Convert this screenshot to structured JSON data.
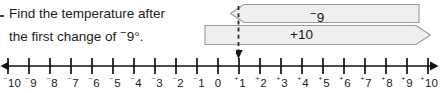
{
  "question": {
    "bullet": "dash-bullet",
    "line1": "Find the temperature after",
    "line2_pre": "the first change of ",
    "line2_value_sign": "−",
    "line2_value": "9°.",
    "full_text": "Find the temperature after the first change of ⁻9°."
  },
  "arrows": [
    {
      "name": "minus-nine-arrow",
      "label_sign": "−",
      "label_value": "9",
      "label": "⁻9",
      "direction": "left",
      "fill": "#efefef",
      "stroke": "#9a9a9a"
    },
    {
      "name": "plus-ten-arrow",
      "label_sign": "+",
      "label_value": "10",
      "label": "+10",
      "direction": "right",
      "fill": "#efefef",
      "stroke": "#9a9a9a"
    }
  ],
  "drop_line": {
    "name": "dashed-indicator",
    "points_to": "+1",
    "style": "dashed",
    "color": "#2b2b2b"
  },
  "number_line": {
    "min": -10,
    "max": 10,
    "step": 1,
    "left_arrow": true,
    "right_arrow": true,
    "axis_color": "#111111",
    "labels": [
      {
        "sign": "⁻",
        "value": "10",
        "text": "⁻10"
      },
      {
        "sign": "⁻",
        "value": "9",
        "text": "⁻9"
      },
      {
        "sign": "⁻",
        "value": "8",
        "text": "⁻8"
      },
      {
        "sign": "⁻",
        "value": "7",
        "text": "⁻7"
      },
      {
        "sign": "⁻",
        "value": "6",
        "text": "⁻6"
      },
      {
        "sign": "⁻",
        "value": "5",
        "text": "⁻5"
      },
      {
        "sign": "⁻",
        "value": "4",
        "text": "⁻4"
      },
      {
        "sign": "⁻",
        "value": "3",
        "text": "⁻3"
      },
      {
        "sign": "⁻",
        "value": "2",
        "text": "⁻2"
      },
      {
        "sign": "⁻",
        "value": "1",
        "text": "⁻1"
      },
      {
        "sign": "",
        "value": "0",
        "text": "0"
      },
      {
        "sign": "⁺",
        "value": "1",
        "text": "⁺1"
      },
      {
        "sign": "⁺",
        "value": "2",
        "text": "⁺2"
      },
      {
        "sign": "⁺",
        "value": "3",
        "text": "⁺3"
      },
      {
        "sign": "⁺",
        "value": "4",
        "text": "⁺4"
      },
      {
        "sign": "⁺",
        "value": "5",
        "text": "⁺5"
      },
      {
        "sign": "⁺",
        "value": "6",
        "text": "⁺6"
      },
      {
        "sign": "⁺",
        "value": "7",
        "text": "⁺7"
      },
      {
        "sign": "⁺",
        "value": "8",
        "text": "⁺8"
      },
      {
        "sign": "⁺",
        "value": "9",
        "text": "⁺9"
      },
      {
        "sign": "⁺",
        "value": "10",
        "text": "⁺10"
      }
    ]
  },
  "colors": {
    "text": "#1c1c1c",
    "banner_fill": "#efefef",
    "banner_stroke": "#9a9a9a",
    "axis": "#111111"
  }
}
